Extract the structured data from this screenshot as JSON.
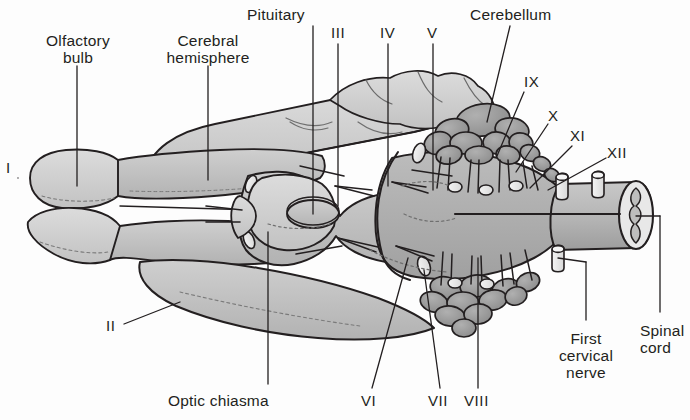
{
  "figure": {
    "background_color": "#fdfdfd",
    "ink_color": "#231f20",
    "tissue_fill_light": "#cfcfcf",
    "tissue_fill_mid": "#bdbdbd",
    "tissue_fill_dark": "#a6a6a6",
    "cerebellum_fill": "#9a9a9a",
    "nerve_stub_fill": "#efefef"
  },
  "labels": {
    "olfactory_bulb": "Olfactory\nbulb",
    "cerebral_hemisphere": "Cerebral\nhemisphere",
    "pituitary": "Pituitary",
    "cerebellum": "Cerebellum",
    "optic_chiasma": "Optic chiasma",
    "first_cervical_nerve": "First\ncervical\nnerve",
    "spinal_cord": "Spinal\ncord"
  },
  "cranial_nerves": {
    "i": "I",
    "ii": "II",
    "iii": "III",
    "iv": "IV",
    "v": "V",
    "vi": "VI",
    "vii": "VII",
    "viii": "VIII",
    "ix": "IX",
    "x": "X",
    "xi": "XI",
    "xii": "XII"
  },
  "label_positions": {
    "olfactory_bulb": {
      "x": 8,
      "y": 32
    },
    "cerebral_hemisphere": {
      "x": 128,
      "y": 32
    },
    "pituitary": {
      "x": 247,
      "y": 6
    },
    "cerebellum": {
      "x": 470,
      "y": 6
    },
    "optic_chiasma": {
      "x": 168,
      "y": 392
    },
    "first_cervical_nerve": {
      "x": 557,
      "y": 330
    },
    "spinal_cord": {
      "x": 640,
      "y": 322
    },
    "i": {
      "x": 6,
      "y": 160
    },
    "ii": {
      "x": 106,
      "y": 318
    },
    "iii": {
      "x": 331,
      "y": 25
    },
    "iv": {
      "x": 380,
      "y": 25
    },
    "v": {
      "x": 427,
      "y": 25
    },
    "vi": {
      "x": 361,
      "y": 393
    },
    "vii": {
      "x": 428,
      "y": 393
    },
    "viii": {
      "x": 464,
      "y": 393
    },
    "ix": {
      "x": 524,
      "y": 74
    },
    "x": {
      "x": 548,
      "y": 108
    },
    "xi": {
      "x": 570,
      "y": 128
    },
    "xii": {
      "x": 607,
      "y": 145
    }
  }
}
